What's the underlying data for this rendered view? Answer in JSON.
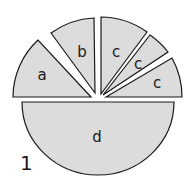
{
  "figure": {
    "number": "1",
    "fill_color": "#dcdcdc",
    "stroke_color": "#1a1a1a",
    "pieces": [
      {
        "label": "a",
        "start_deg": 180,
        "end_deg": 133
      },
      {
        "label": "b",
        "start_deg": 128,
        "end_deg": 93
      },
      {
        "label": "c",
        "start_deg": 88,
        "end_deg": 58
      },
      {
        "label": "c",
        "start_deg": 54,
        "end_deg": 37
      },
      {
        "label": "c",
        "start_deg": 33,
        "end_deg": 0
      },
      {
        "label": "d",
        "start_deg": 180,
        "end_deg": 360
      }
    ]
  }
}
